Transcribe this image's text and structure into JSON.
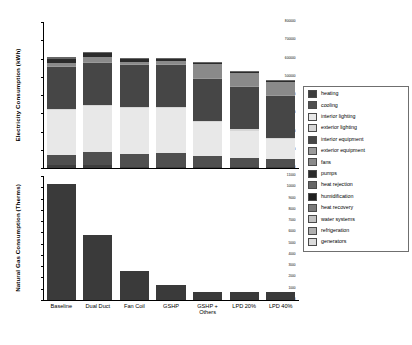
{
  "chart_data": {
    "type": "bar",
    "title": "",
    "layout": "two stacked vertical panels sharing one category axis",
    "categories": [
      "Baseline",
      "Dual Duct",
      "Fan Coil",
      "GSHP",
      "GSHP +\nOthers",
      "LPD 20%",
      "LPD 40%"
    ],
    "legend_position": "right",
    "grid": false,
    "panels": [
      {
        "id": "electricity",
        "type": "bar",
        "stacked": true,
        "ylabel": "Electricity Consumption (kWh)",
        "ylim": [
          0,
          800000
        ],
        "yticks": [
          0,
          100000,
          200000,
          300000,
          400000,
          500000,
          600000,
          700000,
          800000
        ],
        "ytick_labels": [
          "0",
          "100000",
          "200000",
          "300000",
          "400000",
          "500000",
          "600000",
          "700000",
          "800000"
        ],
        "series": [
          {
            "name": "heating",
            "color": "#3d3d3d",
            "values": [
              14000,
              16000,
              5000,
              5000,
              4000,
              3500,
              3000
            ]
          },
          {
            "name": "cooling",
            "color": "#4f4f4f",
            "values": [
              56000,
              74000,
              74000,
              76000,
              62000,
              52000,
              45000
            ]
          },
          {
            "name": "interior lighting",
            "color": "#e8e8e8",
            "values": [
              248000,
              248000,
              248000,
              248000,
              186000,
              150000,
              112000
            ]
          },
          {
            "name": "exterior lighting",
            "color": "#d6d6d6",
            "values": [
              6000,
              6000,
              6000,
              6000,
              6000,
              6000,
              6000
            ]
          },
          {
            "name": "interior equipment",
            "color": "#464646",
            "values": [
              232000,
              232000,
              232000,
              232000,
              232000,
              232000,
              232000
            ]
          },
          {
            "name": "exterior equipment",
            "color": "#9a9a9a",
            "values": [
              4000,
              4000,
              4000,
              4000,
              4000,
              4000,
              4000
            ]
          },
          {
            "name": "fans",
            "color": "#8a8a8a",
            "values": [
              16000,
              26000,
              14000,
              16000,
              74000,
              72000,
              70000
            ]
          },
          {
            "name": "pumps",
            "color": "#2b2b2b",
            "values": [
              24000,
              22000,
              12000,
              10000,
              8000,
              8000,
              8000
            ]
          },
          {
            "name": "heat rejection",
            "color": "#666666",
            "values": [
              8000,
              10000,
              8000,
              6000,
              4000,
              4000,
              4000
            ]
          },
          {
            "name": "humidification",
            "color": "#1f1f1f",
            "values": [
              0,
              0,
              0,
              0,
              0,
              0,
              0
            ]
          },
          {
            "name": "heat recovery",
            "color": "#7a7a7a",
            "values": [
              0,
              0,
              0,
              0,
              0,
              0,
              0
            ]
          },
          {
            "name": "water systems",
            "color": "#c2c2c2",
            "values": [
              0,
              0,
              0,
              0,
              0,
              0,
              0
            ]
          },
          {
            "name": "refrigeration",
            "color": "#b0b0b0",
            "values": [
              0,
              0,
              0,
              0,
              0,
              0,
              0
            ]
          },
          {
            "name": "generators",
            "color": "#dcdcdc",
            "values": [
              0,
              0,
              0,
              0,
              0,
              0,
              0
            ]
          }
        ],
        "totals": [
          608000,
          638000,
          603000,
          603000,
          580000,
          531500,
          484000
        ]
      },
      {
        "id": "natural_gas",
        "type": "bar",
        "stacked": false,
        "ylabel": "Natural Gas Consumption (Therms)",
        "ylim": [
          0,
          11000
        ],
        "yticks": [
          0,
          1000,
          2000,
          3000,
          4000,
          5000,
          6000,
          7000,
          8000,
          9000,
          10000,
          11000
        ],
        "ytick_labels": [
          "0",
          "1000",
          "2000",
          "3000",
          "4000",
          "5000",
          "6000",
          "7000",
          "8000",
          "9000",
          "10000",
          "11000"
        ],
        "series": [
          {
            "name": "heating",
            "color": "#3a3a3a",
            "values": [
              10300,
              5800,
              2600,
              1350,
              700,
              700,
              750
            ]
          }
        ]
      }
    ],
    "legend_entries": [
      {
        "label": "heating",
        "color": "#3d3d3d"
      },
      {
        "label": "cooling",
        "color": "#4f4f4f"
      },
      {
        "label": "interior lighting",
        "color": "#e8e8e8"
      },
      {
        "label": "exterior lighting",
        "color": "#d6d6d6"
      },
      {
        "label": "interior equipment",
        "color": "#464646"
      },
      {
        "label": "exterior equipment",
        "color": "#9a9a9a"
      },
      {
        "label": "fans",
        "color": "#8a8a8a"
      },
      {
        "label": "pumps",
        "color": "#2b2b2b"
      },
      {
        "label": "heat rejection",
        "color": "#666666"
      },
      {
        "label": "humidification",
        "color": "#1f1f1f"
      },
      {
        "label": "heat recovery",
        "color": "#7a7a7a"
      },
      {
        "label": "water systems",
        "color": "#c2c2c2"
      },
      {
        "label": "refrigeration",
        "color": "#b0b0b0"
      },
      {
        "label": "generators",
        "color": "#dcdcdc"
      }
    ]
  }
}
